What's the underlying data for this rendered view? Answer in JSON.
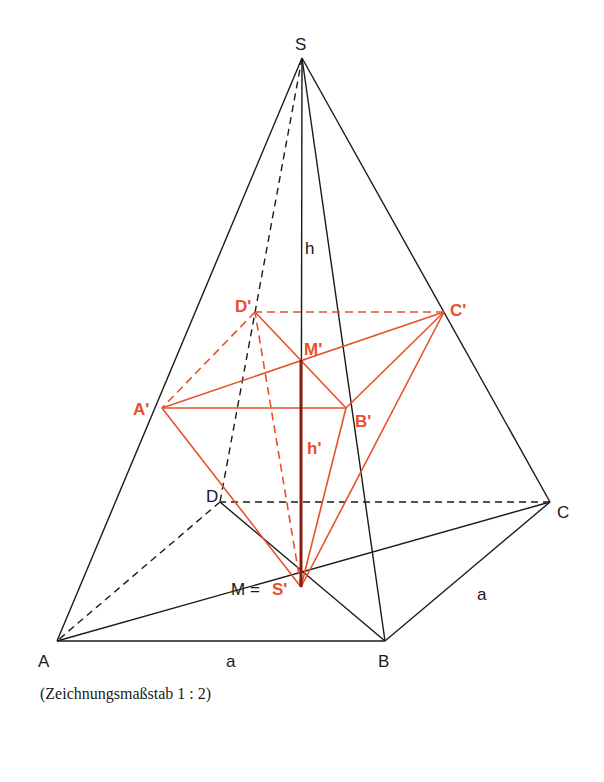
{
  "figure": {
    "caption": "(Zeichnungsmaßstab 1 : 2)",
    "colors": {
      "outer": "#1a1a1a",
      "inner": "#e8502a",
      "height_inner": "#8b1a10"
    },
    "labels": {
      "S": "S",
      "A": "A",
      "B": "B",
      "C": "C",
      "D": "D",
      "M_eq": "M =",
      "S_prime": "S'",
      "A_prime": "A'",
      "B_prime": "B'",
      "C_prime": "C'",
      "D_prime": "D'",
      "M_prime": "M'",
      "h": "h",
      "h_prime": "h'",
      "a_bottom": "a",
      "a_right": "a"
    }
  }
}
